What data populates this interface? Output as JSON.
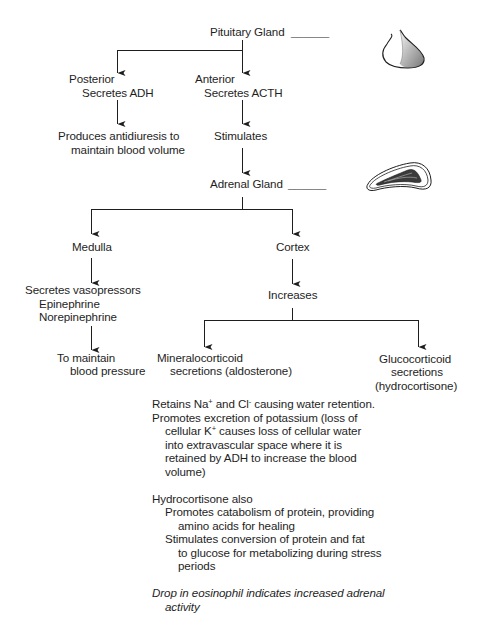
{
  "diagram": {
    "pituitary": {
      "label": "Pituitary Gland",
      "blank": "______",
      "icon": "pituitary-gland-illustration"
    },
    "posterior": {
      "title": "Posterior",
      "action": "Secretes ADH",
      "effect_line1": "Produces antidiuresis to",
      "effect_line2": "maintain blood volume"
    },
    "anterior": {
      "title": "Anterior",
      "action": "Secretes ACTH",
      "effect": "Stimulates"
    },
    "adrenal": {
      "label": "Adrenal Gland",
      "blank": "______",
      "icon": "adrenal-gland-illustration"
    },
    "medulla": {
      "title": "Medulla",
      "line1": "Secretes vasopressors",
      "line2": "Epinephrine",
      "line3": "Norepinephrine",
      "effect_line1": "To maintain",
      "effect_line2": "blood pressure"
    },
    "cortex": {
      "title": "Cortex",
      "effect": "Increases"
    },
    "mineralocorticoid": {
      "line1": "Mineralocorticoid",
      "line2": "secretions (aldosterone)"
    },
    "glucocorticoid": {
      "line1": "Glucocorticoid",
      "line2": "secretions",
      "line3": "(hydrocortisone)"
    },
    "notes": {
      "retains_pre": "Retains Na",
      "retains_sup1": "+",
      "retains_mid": " and Cl",
      "retains_sup2": "-",
      "retains_post": " causing water retention.",
      "promotes_l1": "Promotes excretion of potassium (loss of",
      "promotes_l2_pre": "cellular K",
      "promotes_l2_sup": "+",
      "promotes_l2_post": " causes loss of cellular water",
      "promotes_l3": "into extravascular space where it is",
      "promotes_l4": "retained by ADH to increase the blood",
      "promotes_l5": "volume)",
      "hydro_title": "Hydrocortisone also",
      "hydro_a1": "Promotes catabolism of protein, providing",
      "hydro_a2": "amino acids for healing",
      "hydro_b1": "Stimulates conversion of protein and fat",
      "hydro_b2": "to glucose for metabolizing during stress",
      "hydro_b3": "periods",
      "italic_l1": "Drop in eosinophil indicates increased adrenal",
      "italic_l2": "activity"
    }
  }
}
